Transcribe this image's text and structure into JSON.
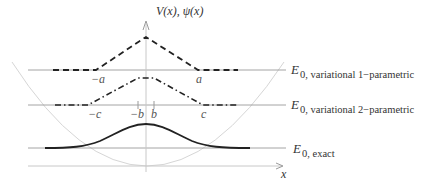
{
  "axes": {
    "y_label": "V(x),  ψ(x)",
    "x_label": "x"
  },
  "ticks": {
    "minus_a": "−a",
    "a": "a",
    "minus_c": "−c",
    "minus_b": "−b",
    "b": "b",
    "c": "c"
  },
  "levels": {
    "variational_1": {
      "E": "E",
      "sub": "0, variational 1−parametric"
    },
    "variational_2": {
      "E": "E",
      "sub": "0, variational 2−parametric"
    },
    "exact": {
      "E": "E",
      "sub": "0, exact"
    }
  },
  "curves": {
    "potential": "harmonic potential V(x) (parabola)",
    "trial_1": "1-parametric triangular trial wavefunction (dashed)",
    "trial_2": "2-parametric trapezoidal trial wavefunction (dash-dot)",
    "exact": "exact Gaussian ground state ψ(x)"
  },
  "colors": {
    "curve": "#222222",
    "axis": "#c8c8c8",
    "level_line": "#9a9a9a",
    "potential": "#d6d6d6"
  }
}
